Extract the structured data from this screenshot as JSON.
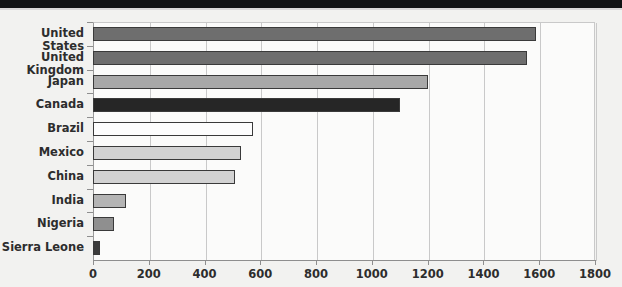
{
  "chart_data": {
    "type": "bar",
    "orientation": "horizontal",
    "title": "",
    "xlabel": "",
    "ylabel": "",
    "xlim": [
      0,
      1800
    ],
    "xticks": [
      0,
      200,
      400,
      600,
      800,
      1000,
      1200,
      1400,
      1600,
      1800
    ],
    "xtick_labels": [
      "0",
      "200",
      "400",
      "600",
      "800",
      "1000",
      "1200",
      "1400",
      "1600",
      "1800"
    ],
    "grid": "vertical",
    "legend": "none",
    "categories": [
      "United States",
      "United Kingdom",
      "Japan",
      "Canada",
      "Brazil",
      "Mexico",
      "China",
      "India",
      "Nigeria",
      "Sierra Leone"
    ],
    "values": [
      1590,
      1555,
      1200,
      1100,
      575,
      530,
      510,
      118,
      75,
      25
    ],
    "bar_colors": [
      "#6e6e6e",
      "#6e6e6e",
      "#a8a8a8",
      "#262626",
      "#fdfdfd",
      "#d2d2d2",
      "#d2d2d2",
      "#b4b4b4",
      "#8f8f8f",
      "#3c3c3c"
    ],
    "bar_edge_color": "#3a3a3a",
    "plot_background": "#fbfbfa",
    "figure_background": "#f2f2f0",
    "gridline_color": "#c9c9c9",
    "axis_color": "#8e8e8e",
    "label_color": "#2d2d2d"
  }
}
